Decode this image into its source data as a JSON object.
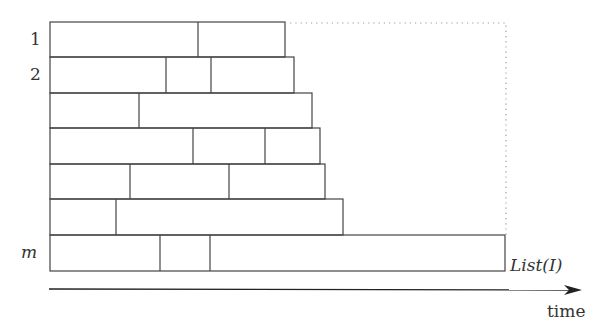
{
  "diagram": {
    "row_labels": [
      {
        "text": "1",
        "row": 0
      },
      {
        "text": "2",
        "row": 1
      },
      {
        "text": "m",
        "row": 6
      }
    ],
    "list_label": "List(I)",
    "time_label": "time",
    "stroke_color": "#444444",
    "dotted_color": "#999999",
    "rows": [
      {
        "y": 22,
        "h": 35,
        "end": 285,
        "dividers": [
          198
        ]
      },
      {
        "y": 57,
        "h": 36,
        "end": 294,
        "dividers": [
          166,
          211
        ]
      },
      {
        "y": 93,
        "h": 35,
        "end": 312,
        "dividers": [
          139
        ]
      },
      {
        "y": 128,
        "h": 36,
        "end": 320,
        "dividers": [
          193,
          265
        ]
      },
      {
        "y": 164,
        "h": 35,
        "end": 325,
        "dividers": [
          130,
          229
        ]
      },
      {
        "y": 199,
        "h": 36,
        "end": 343,
        "dividers": [
          116
        ]
      },
      {
        "y": 235,
        "h": 36,
        "end": 505,
        "dividers": [
          160,
          210
        ]
      }
    ],
    "left_x": 50,
    "dotted_box": {
      "x1": 285,
      "y1": 23,
      "x2": 506,
      "y2": 235
    },
    "time_axis": {
      "x1": 49,
      "y": 289,
      "x2": 582
    }
  }
}
